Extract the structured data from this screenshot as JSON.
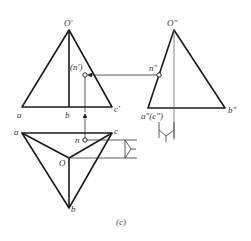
{
  "figure": {
    "caption": "(c)",
    "colors": {
      "stroke": "#1a1a1a",
      "thin": "#333333",
      "background": "#ffffff"
    }
  },
  "front_view": {
    "apex_label": "O'",
    "base_labels": [
      "a",
      "b",
      "c'"
    ],
    "point_label": "(n')"
  },
  "side_view": {
    "apex_label": "O\"",
    "base_left_label": "a\"(c\")",
    "base_right_label": "b\"",
    "point_label": "n\""
  },
  "top_view": {
    "labels": {
      "a": "a",
      "c": "c",
      "O": "O",
      "b": "b",
      "n": "n"
    }
  }
}
